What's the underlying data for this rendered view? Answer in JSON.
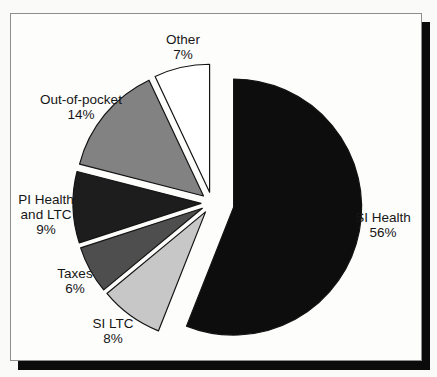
{
  "page": {
    "background": "#fafaf9",
    "panel": {
      "background": "#fdfdfc",
      "border_color": "#8e8e8e",
      "shadow_color": "#0b0b0b"
    }
  },
  "chart_data": {
    "type": "pie",
    "title": "",
    "unit": "%",
    "total": 100,
    "legend": "none",
    "start_angle_deg": 0,
    "clockwise": true,
    "categories": [
      "SI Health",
      "SI LTC",
      "Taxes",
      "PI Health and LTC",
      "Out-of-pocket",
      "Other"
    ],
    "values": [
      56,
      8,
      6,
      9,
      14,
      7
    ],
    "slices": [
      {
        "name": "SI Health",
        "value": 56,
        "pct": "56%",
        "color": "#0d0d0d",
        "explode": 22,
        "label_lines": [
          "SI Health",
          "56%"
        ],
        "label_x": 383,
        "label_y": 222
      },
      {
        "name": "SI LTC",
        "value": 8,
        "pct": "8%",
        "color": "#c7c7c7",
        "explode": 11,
        "label_lines": [
          "SI LTC",
          "8%"
        ],
        "label_x": 113,
        "label_y": 328
      },
      {
        "name": "Taxes",
        "value": 6,
        "pct": "6%",
        "color": "#4e4e4e",
        "explode": 11,
        "label_lines": [
          "Taxes",
          "6%"
        ],
        "label_x": 75,
        "label_y": 278
      },
      {
        "name": "PI Health and LTC",
        "value": 9,
        "pct": "9%",
        "color": "#1d1d1d",
        "explode": 11,
        "label_lines": [
          "PI Health",
          "and LTC",
          "9%"
        ],
        "label_x": 46,
        "label_y": 204
      },
      {
        "name": "Out-of-pocket",
        "value": 14,
        "pct": "14%",
        "color": "#828282",
        "explode": 11,
        "label_lines": [
          "Out-of-pocket",
          "14%"
        ],
        "label_x": 81,
        "label_y": 104
      },
      {
        "name": "Other",
        "value": 7,
        "pct": "7%",
        "color": "#ffffff",
        "explode": 11,
        "label_lines": [
          "Other",
          "7%"
        ],
        "label_x": 183,
        "label_y": 44
      }
    ],
    "geometry": {
      "cx": 212,
      "cy": 203,
      "radius": 128
    },
    "label_font_px": 13.5,
    "label_line_height_px": 15,
    "text_color": "#161616",
    "stroke_color": "#141414"
  }
}
